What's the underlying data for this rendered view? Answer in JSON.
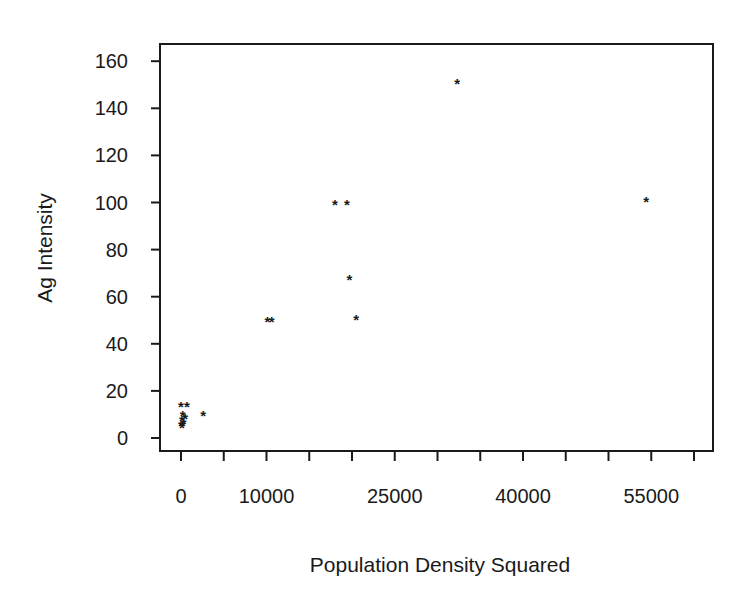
{
  "chart_data": {
    "type": "scatter",
    "title": "",
    "xlabel": "Population Density Squared",
    "ylabel": "Ag Intensity",
    "xlim": [
      -2200,
      62800
    ],
    "ylim": [
      -6,
      166
    ],
    "x_ticks": [
      0,
      5000,
      10000,
      15000,
      20000,
      25000,
      30000,
      35000,
      40000,
      45000,
      50000,
      55000,
      60000
    ],
    "x_tick_labels": [
      {
        "value": 0,
        "label": "0"
      },
      {
        "value": 10000,
        "label": "10000"
      },
      {
        "value": 25000,
        "label": "25000"
      },
      {
        "value": 40000,
        "label": "40000"
      },
      {
        "value": 55000,
        "label": "55000"
      }
    ],
    "y_ticks": [
      0,
      20,
      40,
      60,
      80,
      100,
      120,
      140,
      160
    ],
    "y_tick_labels": [
      "0",
      "20",
      "40",
      "60",
      "80",
      "100",
      "120",
      "140",
      "160"
    ],
    "grid": false,
    "legend": null,
    "marker": "*",
    "series": [
      {
        "name": "observations",
        "points": [
          {
            "x": 0,
            "y": 14
          },
          {
            "x": 700,
            "y": 14
          },
          {
            "x": 200,
            "y": 10
          },
          {
            "x": 500,
            "y": 9
          },
          {
            "x": 100,
            "y": 8
          },
          {
            "x": 300,
            "y": 7
          },
          {
            "x": 0,
            "y": 6
          },
          {
            "x": 200,
            "y": 6
          },
          {
            "x": 100,
            "y": 5
          },
          {
            "x": 2600,
            "y": 10
          },
          {
            "x": 10100,
            "y": 50
          },
          {
            "x": 10600,
            "y": 50
          },
          {
            "x": 18000,
            "y": 100
          },
          {
            "x": 19400,
            "y": 100
          },
          {
            "x": 19700,
            "y": 68
          },
          {
            "x": 20500,
            "y": 51
          },
          {
            "x": 32300,
            "y": 151
          },
          {
            "x": 54400,
            "y": 101
          }
        ]
      }
    ]
  }
}
